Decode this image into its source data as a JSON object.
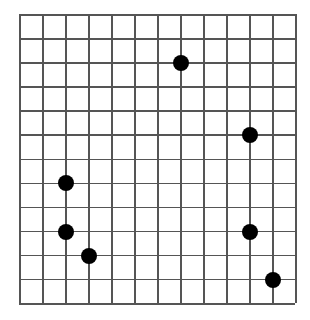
{
  "board": {
    "columns": 12,
    "rows": 12,
    "line_color": "#555555",
    "stone_color": "#000000",
    "stones": [
      {
        "col": 7,
        "row": 2,
        "color": "black"
      },
      {
        "col": 10,
        "row": 5,
        "color": "black"
      },
      {
        "col": 2,
        "row": 7,
        "color": "black"
      },
      {
        "col": 2,
        "row": 9,
        "color": "black"
      },
      {
        "col": 10,
        "row": 9,
        "color": "black"
      },
      {
        "col": 3,
        "row": 10,
        "color": "black"
      },
      {
        "col": 11,
        "row": 11,
        "color": "black"
      }
    ]
  }
}
